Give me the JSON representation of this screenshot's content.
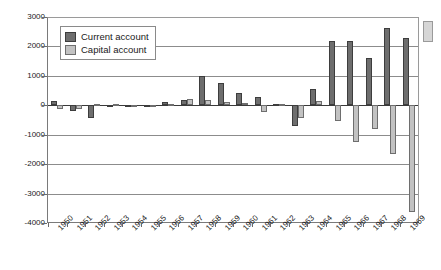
{
  "chart_data": {
    "type": "bar",
    "title": "",
    "xlabel": "",
    "ylabel": "",
    "ylim": [
      -4000,
      3000
    ],
    "ytick_step": 1000,
    "grid": true,
    "legend_position": "top-left",
    "yticks": [
      "3000",
      "2000",
      "1000",
      "0",
      "-1000",
      "-2000",
      "-3000",
      "-4000"
    ],
    "categories": [
      "1950",
      "1951",
      "1952",
      "1953",
      "1954",
      "1955",
      "1956",
      "1957",
      "1958",
      "1959",
      "1960",
      "1961",
      "1962",
      "1963",
      "1964",
      "1965",
      "1966",
      "1967",
      "1968",
      "1969"
    ],
    "series": [
      {
        "name": "Current account",
        "color": "#6e6e6e",
        "values": [
          150,
          -190,
          -420,
          -60,
          -70,
          -60,
          100,
          180,
          1000,
          760,
          420,
          270,
          60,
          -700,
          560,
          2200,
          2200,
          1600,
          2620,
          2300
        ]
      },
      {
        "name": "Capital account",
        "color": "#c2c2c2",
        "values": [
          -130,
          -120,
          30,
          30,
          -50,
          -60,
          30,
          210,
          190,
          110,
          70,
          -240,
          40,
          -430,
          160,
          -520,
          -1250,
          -790,
          -1650,
          -3620
        ]
      }
    ]
  },
  "legend": {
    "items": [
      {
        "label": "Current account",
        "color": "#6e6e6e"
      },
      {
        "label": "Capital account",
        "color": "#c2c2c2"
      }
    ]
  }
}
